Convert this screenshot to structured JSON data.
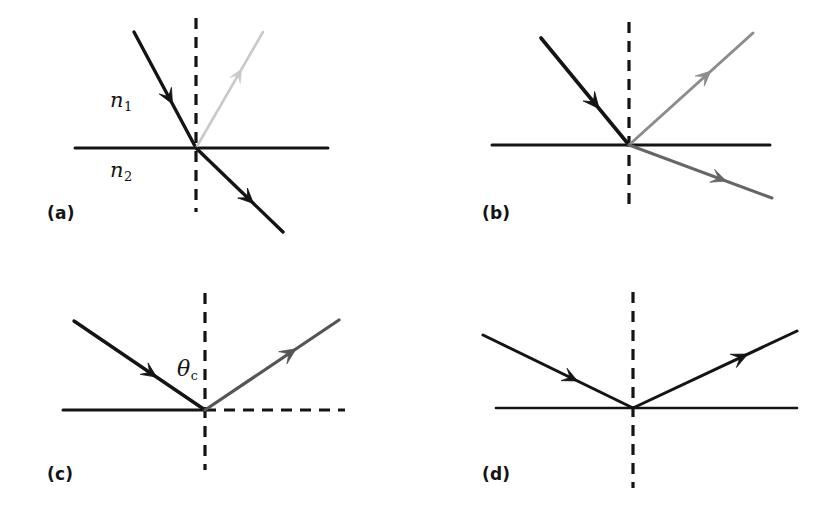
{
  "figure": {
    "background_color": "#ffffff",
    "width": 828,
    "height": 515
  },
  "colors": {
    "incident_ray": "#141414",
    "interface_line": "#141414",
    "normal_dashed": "#141414",
    "reflected_faint": "#c9c9c9",
    "reflected_medium": "#8c8c8c",
    "reflected_dark": "#555555",
    "refracted_dark_gray": "#666666",
    "text": "#141414"
  },
  "panels": [
    {
      "id": "a",
      "label": "(a)",
      "label_pos": {
        "x": 47,
        "y": 203
      },
      "caption_meaning": "Shallow incidence: strong refraction into medium 2, weak reflection",
      "vertex": {
        "x": 196,
        "y": 148
      },
      "interface": {
        "x1": 75,
        "y1": 148,
        "x2": 328,
        "y2": 148,
        "style": "solid",
        "color": "#141414",
        "width": 3
      },
      "normal": {
        "x1": 196,
        "y1": 18,
        "x2": 196,
        "y2": 212,
        "style": "dashed",
        "color": "#141414",
        "width": 3.2
      },
      "labels": [
        {
          "name": "n1",
          "symbol": "n",
          "subscript": "1",
          "x": 110,
          "y": 88
        },
        {
          "name": "n2",
          "symbol": "n",
          "subscript": "2",
          "x": 110,
          "y": 158
        }
      ],
      "rays": [
        {
          "name": "incident-ray",
          "kind": "incident",
          "color": "#141414",
          "width": 3.4,
          "x1": 134,
          "y1": 32,
          "x2": 196,
          "y2": 148,
          "arrow_at": 0.62,
          "arrow_size": 15
        },
        {
          "name": "reflected-ray",
          "kind": "reflected",
          "color": "#c9c9c9",
          "width": 2.6,
          "x1": 196,
          "y1": 148,
          "x2": 263,
          "y2": 32,
          "arrow_at": 0.68,
          "arrow_size": 13
        },
        {
          "name": "refracted-ray",
          "kind": "refracted",
          "color": "#141414",
          "width": 3.4,
          "x1": 196,
          "y1": 148,
          "x2": 283,
          "y2": 232,
          "arrow_at": 0.66,
          "arrow_size": 15
        }
      ]
    },
    {
      "id": "b",
      "label": "(b)",
      "label_pos": {
        "x": 482,
        "y": 203
      },
      "caption_meaning": "Larger incidence angle: refraction closer to interface, stronger reflection",
      "vertex": {
        "x": 629,
        "y": 145
      },
      "interface": {
        "x1": 492,
        "y1": 145,
        "x2": 770,
        "y2": 145,
        "style": "solid",
        "color": "#141414",
        "width": 3
      },
      "normal": {
        "x1": 629,
        "y1": 22,
        "x2": 629,
        "y2": 212,
        "style": "dashed",
        "color": "#141414",
        "width": 3.2
      },
      "labels": [],
      "rays": [
        {
          "name": "incident-ray",
          "kind": "incident",
          "color": "#141414",
          "width": 3.6,
          "x1": 541,
          "y1": 38,
          "x2": 629,
          "y2": 145,
          "arrow_at": 0.66,
          "arrow_size": 16
        },
        {
          "name": "reflected-ray",
          "kind": "reflected",
          "color": "#8c8c8c",
          "width": 3.0,
          "x1": 629,
          "y1": 145,
          "x2": 753,
          "y2": 33,
          "arrow_at": 0.66,
          "arrow_size": 15
        },
        {
          "name": "refracted-ray",
          "kind": "refracted",
          "color": "#666666",
          "width": 3.0,
          "x1": 629,
          "y1": 145,
          "x2": 772,
          "y2": 198,
          "arrow_at": 0.68,
          "arrow_size": 15
        }
      ]
    },
    {
      "id": "c",
      "label": "(c)",
      "label_pos": {
        "x": 47,
        "y": 464
      },
      "caption_meaning": "Critical angle: refracted ray grazes along the interface",
      "vertex": {
        "x": 205,
        "y": 410
      },
      "interface": {
        "x1": 63,
        "y1": 410,
        "x2": 205,
        "y2": 410,
        "style": "solid",
        "color": "#141414",
        "width": 3
      },
      "grazing": {
        "x1": 205,
        "y1": 410,
        "x2": 345,
        "y2": 410,
        "style": "dashed",
        "color": "#141414",
        "width": 3
      },
      "normal": {
        "x1": 205,
        "y1": 293,
        "x2": 205,
        "y2": 470,
        "style": "dashed",
        "color": "#141414",
        "width": 3.2
      },
      "labels": [
        {
          "name": "theta-c",
          "symbol": "θ",
          "subscript": "c",
          "x": 177,
          "y": 356
        }
      ],
      "rays": [
        {
          "name": "incident-ray",
          "kind": "incident",
          "color": "#141414",
          "width": 3.4,
          "x1": 74,
          "y1": 321,
          "x2": 205,
          "y2": 410,
          "arrow_at": 0.63,
          "arrow_size": 15
        },
        {
          "name": "reflected-ray",
          "kind": "reflected",
          "color": "#555555",
          "width": 3.2,
          "x1": 205,
          "y1": 410,
          "x2": 339,
          "y2": 320,
          "arrow_at": 0.68,
          "arrow_size": 16
        }
      ]
    },
    {
      "id": "d",
      "label": "(d)",
      "label_pos": {
        "x": 482,
        "y": 464
      },
      "caption_meaning": "Beyond the critical angle: total internal reflection, no refracted ray",
      "vertex": {
        "x": 633,
        "y": 408
      },
      "interface": {
        "x1": 496,
        "y1": 408,
        "x2": 797,
        "y2": 408,
        "style": "solid",
        "color": "#141414",
        "width": 2.6
      },
      "normal": {
        "x1": 633,
        "y1": 292,
        "x2": 633,
        "y2": 488,
        "style": "dashed",
        "color": "#141414",
        "width": 3.2
      },
      "labels": [],
      "rays": [
        {
          "name": "incident-ray",
          "kind": "incident",
          "color": "#141414",
          "width": 3.0,
          "x1": 483,
          "y1": 335,
          "x2": 633,
          "y2": 408,
          "arrow_at": 0.63,
          "arrow_size": 15
        },
        {
          "name": "reflected-ray",
          "kind": "reflected",
          "color": "#141414",
          "width": 3.0,
          "x1": 633,
          "y1": 408,
          "x2": 797,
          "y2": 331,
          "arrow_at": 0.7,
          "arrow_size": 16
        }
      ]
    }
  ]
}
